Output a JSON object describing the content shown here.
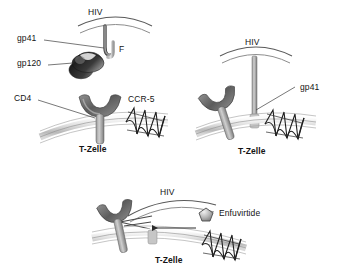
{
  "figure": {
    "title_hidden": "HIV entry into T-cell and Enfuvirtide mechanism",
    "background_color": "#ffffff",
    "line_color": "#3d3d3d",
    "membrane_fill": "#d6d6d6",
    "protein_dark": "#2b2b2b",
    "protein_mid": "#6e6e6e",
    "protein_light": "#c9c9c9"
  },
  "panels": [
    {
      "id": "panel-attachment",
      "labels": {
        "virus": "HIV",
        "gp41": "gp41",
        "gp120": "gp120",
        "fusion_peptide": "F",
        "cd4": "CD4",
        "ccr5": "CCR-5",
        "cell": "T-Zelle"
      }
    },
    {
      "id": "panel-fusion",
      "labels": {
        "virus": "HIV",
        "gp41": "gp41",
        "cell": "T-Zelle"
      }
    },
    {
      "id": "panel-inhibition",
      "labels": {
        "virus": "HIV",
        "drug": "Enfuvirtide",
        "cell": "T-Zelle"
      }
    }
  ],
  "icons": {
    "ccr5_coil": "serpentine-coil-icon",
    "cd4_receptor": "y-shaped-receptor-icon",
    "gp120_knob": "bean-shaped-knob-icon",
    "enfuvirtide_molecule": "pentagon-molecule-icon",
    "inhibition_arrow": "left-arrow-icon"
  }
}
